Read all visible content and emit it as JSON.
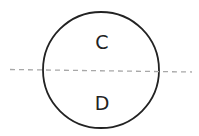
{
  "diagram": {
    "circle": {
      "cx": 101,
      "cy": 70,
      "r": 58,
      "stroke": "#222222",
      "stroke_width": 1.8
    },
    "dashed_line": {
      "x1": 10,
      "y1": 69.5,
      "x2": 192,
      "y2": 72,
      "stroke": "#a8a8a8",
      "dash": "5,4"
    },
    "labels": {
      "top": "C",
      "bottom": "D"
    }
  }
}
